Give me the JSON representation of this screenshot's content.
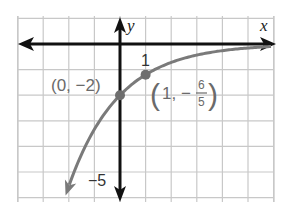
{
  "chart_data": {
    "type": "line",
    "title": "",
    "function": "f(x) = -2(3/5)^x",
    "xlabel": "x",
    "ylabel": "y",
    "xlim": [
      -4,
      6
    ],
    "ylim": [
      -6,
      1
    ],
    "grid": true,
    "unit_px": 25.6,
    "origin_px": [
      120,
      44
    ],
    "tick_labels": [
      {
        "axis": "x",
        "value": 1,
        "text": "1"
      },
      {
        "axis": "y",
        "value": -5,
        "text": "−5"
      }
    ],
    "points": [
      {
        "x": 0,
        "y": -2,
        "label": "(0, −2)"
      },
      {
        "x": 1,
        "y": -1.2,
        "label": "(1, −",
        "frac_num": "6",
        "frac_den": "5",
        "label_end": ")"
      }
    ],
    "curve_samples": [
      {
        "x": -2.05,
        "y": -5.69
      },
      {
        "x": -1.5,
        "y": -4.3
      },
      {
        "x": -1,
        "y": -3.33
      },
      {
        "x": -0.5,
        "y": -2.58
      },
      {
        "x": 0,
        "y": -2
      },
      {
        "x": 0.5,
        "y": -1.55
      },
      {
        "x": 1,
        "y": -1.2
      },
      {
        "x": 2,
        "y": -0.72
      },
      {
        "x": 3,
        "y": -0.43
      },
      {
        "x": 4,
        "y": -0.26
      },
      {
        "x": 5,
        "y": -0.16
      },
      {
        "x": 6,
        "y": -0.09
      }
    ],
    "colors": {
      "curve": "#7a7a7a",
      "axes": "#111111",
      "grid": "#c8c8c8",
      "points": "#6e6e6e",
      "labels": "#6a6a6a"
    }
  }
}
